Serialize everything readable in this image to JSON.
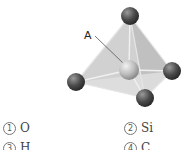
{
  "figure": {
    "label": "A"
  },
  "options": [
    {
      "number": "1",
      "text": "O"
    },
    {
      "number": "2",
      "text": "Si"
    },
    {
      "number": "3",
      "text": "H"
    },
    {
      "number": "4",
      "text": "C"
    }
  ]
}
